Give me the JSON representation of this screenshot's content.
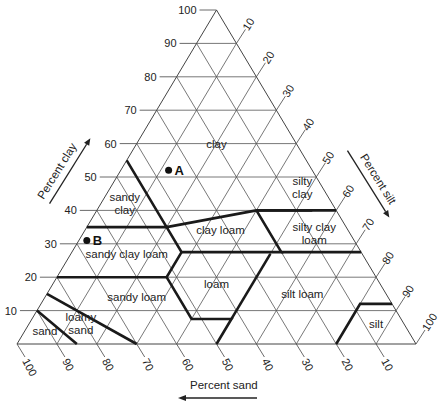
{
  "diagram": {
    "axes": {
      "clay": {
        "label": "Percent clay",
        "ticks": [
          10,
          20,
          30,
          40,
          50,
          60,
          70,
          80,
          90,
          100
        ],
        "side": "left"
      },
      "silt": {
        "label": "Percent silt",
        "ticks": [
          10,
          20,
          30,
          40,
          50,
          60,
          70,
          80,
          90,
          100
        ],
        "side": "right"
      },
      "sand": {
        "label": "Percent sand",
        "ticks": [
          100,
          90,
          80,
          70,
          60,
          50,
          40,
          30,
          20,
          10
        ],
        "side": "bottom"
      }
    },
    "classes": [
      {
        "name": "clay",
        "label_lines": [
          "clay"
        ],
        "at": [
          20,
          20,
          60
        ]
      },
      {
        "name": "sandy clay",
        "label_lines": [
          "sandy",
          "clay"
        ],
        "at": [
          52,
          6,
          42
        ]
      },
      {
        "name": "silty clay",
        "label_lines": [
          "silty",
          "clay"
        ],
        "at": [
          5,
          48,
          47
        ]
      },
      {
        "name": "clay loam",
        "label_lines": [
          "clay loam"
        ],
        "at": [
          32,
          34,
          34
        ]
      },
      {
        "name": "silty clay loam",
        "label_lines": [
          "silty clay",
          "loam"
        ],
        "at": [
          9,
          58,
          33
        ]
      },
      {
        "name": "sandy clay loam",
        "label_lines": [
          "sandy clay loam"
        ],
        "at": [
          59,
          14,
          27
        ]
      },
      {
        "name": "loam",
        "label_lines": [
          "loam"
        ],
        "at": [
          41,
          41,
          18
        ]
      },
      {
        "name": "sandy loam",
        "label_lines": [
          "sandy loam"
        ],
        "at": [
          63,
          23,
          14
        ]
      },
      {
        "name": "silt loam",
        "label_lines": [
          "silt loam"
        ],
        "at": [
          21,
          64,
          15
        ]
      },
      {
        "name": "loamy sand",
        "label_lines": [
          "loamy",
          "sand"
        ],
        "at": [
          81,
          13,
          6
        ]
      },
      {
        "name": "sand",
        "label_lines": [
          "sand"
        ],
        "at": [
          91,
          5,
          4
        ]
      },
      {
        "name": "silt",
        "label_lines": [
          "silt"
        ],
        "at": [
          7,
          87,
          6
        ]
      }
    ],
    "points": [
      {
        "label": "A",
        "sand": 36,
        "silt": 12,
        "clay": 52
      },
      {
        "label": "B",
        "sand": 67,
        "silt": 2,
        "clay": 31
      }
    ],
    "boundaries": [
      [
        [
          45,
          0,
          55
        ],
        [
          45,
          20,
          35
        ],
        [
          65,
          0,
          35
        ]
      ],
      [
        [
          45,
          20,
          35
        ],
        [
          20,
          40,
          40
        ],
        [
          0,
          60,
          40
        ]
      ],
      [
        [
          20,
          40,
          40
        ],
        [
          6,
          54,
          40
        ]
      ],
      [
        [
          20,
          40,
          40
        ],
        [
          20,
          52.5,
          27.5
        ],
        [
          45,
          27.5,
          27.5
        ],
        [
          45,
          20,
          35
        ]
      ],
      [
        [
          45,
          27.5,
          27.5
        ],
        [
          52.5,
          27.5,
          20
        ],
        [
          80,
          0,
          20
        ]
      ],
      [
        [
          20,
          52.5,
          27.5
        ],
        [
          0,
          72.5,
          27.5
        ]
      ],
      [
        [
          52.5,
          27.5,
          20
        ],
        [
          52.5,
          40,
          7.5
        ],
        [
          42.5,
          50,
          7.5
        ],
        [
          50,
          50,
          0
        ]
      ],
      [
        [
          42.5,
          50,
          7.5
        ],
        [
          23,
          50,
          27
        ]
      ],
      [
        [
          85,
          0,
          15
        ],
        [
          70,
          30,
          0
        ]
      ],
      [
        [
          90,
          0,
          10
        ],
        [
          85,
          15,
          0
        ]
      ],
      [
        [
          20,
          80,
          0
        ],
        [
          12,
          80,
          8
        ],
        [
          8,
          80,
          12
        ],
        [
          0,
          88,
          12
        ]
      ],
      [
        [
          0,
          60,
          40
        ],
        [
          0,
          60,
          40
        ]
      ]
    ],
    "colors": {
      "grid": "#555555",
      "boundary": "#1a1a1a",
      "text": "#222222"
    }
  }
}
